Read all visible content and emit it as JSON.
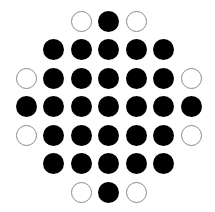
{
  "diagram": {
    "type": "peg-grid",
    "rows": 7,
    "cols": 7,
    "legend": {
      "X": "filled circle",
      "O": "empty circle",
      ".": "no hole"
    },
    "grid": [
      ". . O X O . .",
      ". X X X X X .",
      "O X X X X X O",
      "X X X X X X X",
      "O X X X X X O",
      ". X X X X X .",
      ". . O X O . ."
    ],
    "colors": {
      "filled": "#000000",
      "outline": "#8a8a8a",
      "background": "#ffffff"
    },
    "counts": {
      "filled": 29,
      "empty": 8
    }
  }
}
